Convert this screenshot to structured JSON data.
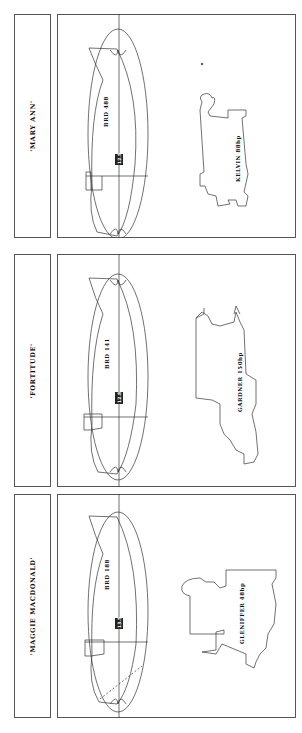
{
  "panels": [
    {
      "vessel_name": "'MARY ANN'",
      "hull_label": "BRD 488",
      "station_label": "12.5",
      "engine_label": "KELVIN 88hp"
    },
    {
      "vessel_name": "'FORTITUDE'",
      "hull_label": "BRD 141",
      "station_label": "12.8",
      "engine_label": "GARDNER 150hp"
    },
    {
      "vessel_name": "'MAGGIE MACDONALD'",
      "hull_label": "BRD 188",
      "station_label": "13.5",
      "engine_label": "GLENIFFER 48hp"
    }
  ],
  "colors": {
    "line": "#333333",
    "background": "#ffffff"
  }
}
